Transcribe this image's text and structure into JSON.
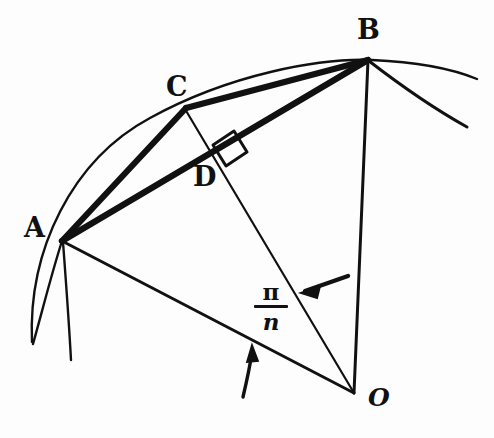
{
  "figure": {
    "kind": "hand-drawn geometry diagram",
    "background_color": "#fdfdfd",
    "ink_color": "#111111",
    "labels": {
      "A": "A",
      "B": "B",
      "C": "C",
      "D": "D",
      "O": "O",
      "angle_numerator": "π",
      "angle_denominator": "n"
    },
    "points": {
      "A": {
        "label": "A",
        "x": 62,
        "y": 241
      },
      "B": {
        "label": "B",
        "x": 368,
        "y": 60
      },
      "C": {
        "label": "C",
        "x": 186,
        "y": 108
      },
      "D": {
        "label": "D",
        "x": 222,
        "y": 158
      },
      "O": {
        "label": "O",
        "x": 354,
        "y": 393
      }
    },
    "label_positions": {
      "A": {
        "x": 24,
        "y": 214
      },
      "B": {
        "x": 357,
        "y": 16
      },
      "C": {
        "x": 166,
        "y": 73
      },
      "D": {
        "x": 193,
        "y": 163
      },
      "O": {
        "x": 368,
        "y": 385
      }
    },
    "segments": [
      {
        "name": "chord-AC",
        "from": "A",
        "to": "C",
        "weight": "thick"
      },
      {
        "name": "chord-CB",
        "from": "C",
        "to": "B",
        "weight": "thick"
      },
      {
        "name": "chord-AB",
        "from": "A",
        "to": "B",
        "weight": "thick"
      },
      {
        "name": "radius-AO",
        "from": "A",
        "to": "O",
        "weight": "medium"
      },
      {
        "name": "radius-BO",
        "from": "B",
        "to": "O",
        "weight": "medium"
      },
      {
        "name": "radius-CO",
        "from": "C",
        "to": "O",
        "weight": "thin"
      }
    ],
    "arc": {
      "name": "circle-arc-through-A-C-B",
      "description": "circular arc of the circumscribed circle passing through A, C and B, extending past both ends",
      "center_x": 354,
      "center_y": 393,
      "radius": 340
    },
    "right_angle": {
      "name": "right-angle-at-D",
      "vertex": "D",
      "description": "square marker showing CO is perpendicular to AB at D"
    },
    "annotations": [
      {
        "name": "angle-arrow-upper",
        "description": "straight arrow pointing down-left toward the CO radius",
        "target": "line CO"
      },
      {
        "name": "angle-arrow-lower",
        "description": "curved arrow pointing up toward the AO radius",
        "target": "line AO"
      },
      {
        "name": "angle-value-label",
        "description": "central angle measure between radii AO and CO",
        "text": "π/n"
      }
    ]
  }
}
